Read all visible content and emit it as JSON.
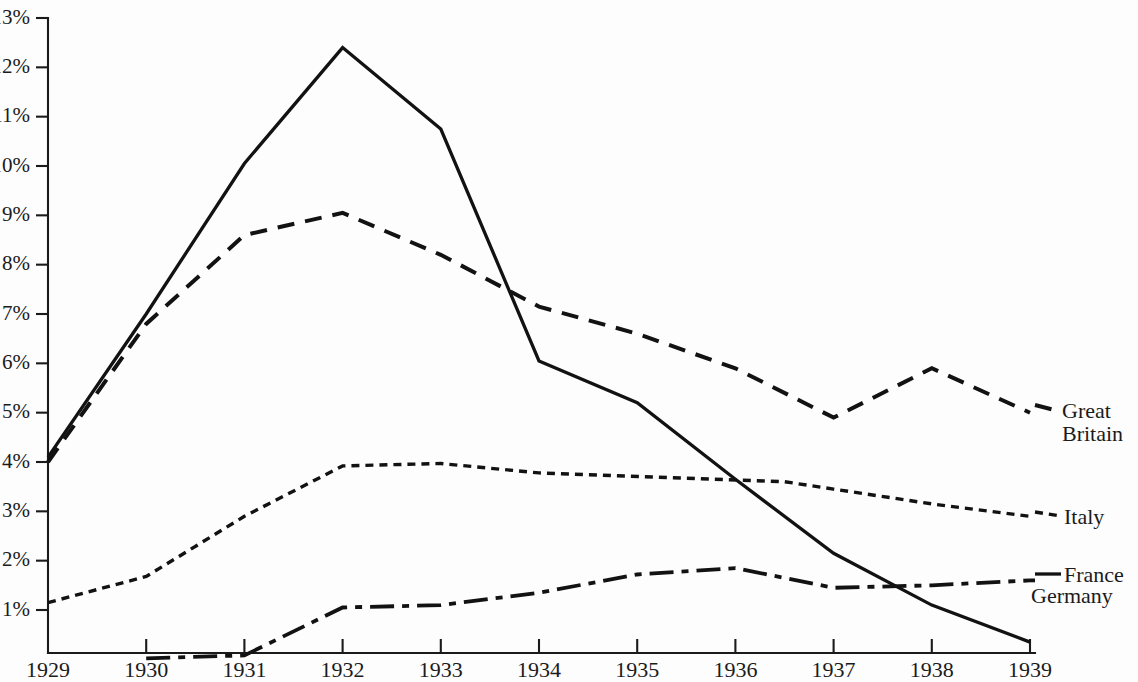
{
  "chart_data": {
    "type": "line",
    "title": "",
    "subtitle": "",
    "xlabel": "",
    "ylabel": "",
    "x": [
      1929,
      1930,
      1931,
      1932,
      1933,
      1934,
      1935,
      1936,
      1937,
      1938,
      1939
    ],
    "xtick_labels": [
      "1929",
      "1930",
      "1931",
      "1932",
      "1933",
      "1934",
      "1935",
      "1936",
      "1937",
      "1938",
      "1939"
    ],
    "ytick_labels": [
      "1%",
      "2%",
      "3%",
      "4%",
      "5%",
      "6%",
      "7%",
      "8%",
      "9%",
      "10%",
      "11%",
      "12%",
      "13%"
    ],
    "ytick_values": [
      1,
      2,
      3,
      4,
      5,
      6,
      7,
      8,
      9,
      10,
      11,
      12,
      13
    ],
    "ylim": [
      0,
      13
    ],
    "xlim": [
      1929,
      1939
    ],
    "grid": false,
    "legend_position": "right-inline-labels",
    "series": [
      {
        "name": "France",
        "label": "France",
        "style": "solid",
        "x": [
          1929,
          1930,
          1931,
          1932,
          1933,
          1934,
          1935,
          1936,
          1937,
          1938,
          1939
        ],
        "values": [
          4.1,
          7.0,
          10.05,
          12.4,
          10.75,
          6.05,
          5.2,
          3.65,
          2.15,
          1.1,
          0.35
        ]
      },
      {
        "name": "Great Britain",
        "label": "Great Britain",
        "label_lines": [
          "Great",
          "Britain"
        ],
        "style": "dashed",
        "x": [
          1929,
          1930,
          1931,
          1932,
          1933,
          1934,
          1935,
          1936,
          1937,
          1938,
          1939
        ],
        "values": [
          4.0,
          6.8,
          8.6,
          9.05,
          8.2,
          7.15,
          6.6,
          5.9,
          4.9,
          5.9,
          5.0
        ]
      },
      {
        "name": "Italy",
        "label": "Italy",
        "style": "dotted",
        "note": "data gap between 1934 and mid-1936",
        "x": [
          1929,
          1930,
          1931,
          1932,
          1933,
          1934,
          1936.5,
          1937,
          1938,
          1939
        ],
        "values": [
          1.15,
          1.68,
          2.9,
          3.92,
          3.97,
          3.78,
          3.6,
          3.45,
          3.15,
          2.9
        ]
      },
      {
        "name": "Germany",
        "label": "Germany",
        "style": "dash-dot",
        "x": [
          1930,
          1931,
          1932,
          1933,
          1934,
          1935,
          1936,
          1937,
          1938,
          1939
        ],
        "values": [
          0.02,
          0.08,
          1.05,
          1.1,
          1.35,
          1.72,
          1.85,
          1.45,
          1.5,
          1.6
        ]
      }
    ]
  },
  "colors": {
    "background": "#fdfdfd",
    "ink": "#121212",
    "axis": "#1a1a1a"
  },
  "labels": {
    "great_britain_line1": "Great",
    "great_britain_line2": "Britain",
    "italy": "Italy",
    "france": "France",
    "germany": "Germany"
  }
}
